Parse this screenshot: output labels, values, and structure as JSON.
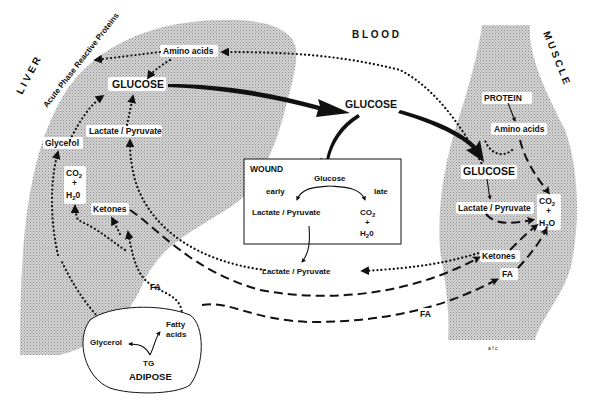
{
  "regions": {
    "liver": "L I V E R",
    "blood": "B L O O D",
    "muscle": "M U S C L E",
    "wound": "WOUND",
    "adipose": "ADIPOSE"
  },
  "liver": {
    "acute_phase": "Acute Phase Reactive Proteins",
    "amino_acids": "Amino  acids",
    "glucose": "GLUCOSE",
    "lactate_pyruvate": "Lactate / Pyruvate",
    "glycerol": "Glycerol",
    "co2": "CO",
    "co2_sub": "2",
    "plus": "+",
    "h2o_h": "H",
    "h2o_sub": "2",
    "h2o_o": "0",
    "ketones": "Ketones"
  },
  "blood": {
    "glucose": "GLUCOSE",
    "lactate_pyruvate": "Lactate / Pyruvate",
    "fa_left": "FA",
    "fa_right": "FA"
  },
  "wound": {
    "title": "WOUND",
    "glucose": "Glucose",
    "early": "early",
    "late": "late",
    "lactate_pyruvate": "Lactate / Pyruvate",
    "co2": "CO",
    "co2_sub": "2",
    "plus": "+",
    "h2o_h": "H",
    "h2o_sub": "2",
    "h2o_o": "0"
  },
  "muscle": {
    "protein": "PROTEIN",
    "amino_acids": "Amino  acids",
    "glucose": "GLUCOSE",
    "lactate_pyruvate": "Lactate / Pyruvate",
    "co2": "CO",
    "co2_sub": "2",
    "plus": "+",
    "h2o_h": "H",
    "h2o_sub": "2",
    "h2o_o": "O",
    "ketones": "Ketones",
    "fa": "FA"
  },
  "adipose": {
    "title": "ADIPOSE",
    "glycerol": "Glycerol",
    "fatty": "Fatty",
    "acids": "acids",
    "tg": "TG"
  },
  "footer_mark": "a f c"
}
